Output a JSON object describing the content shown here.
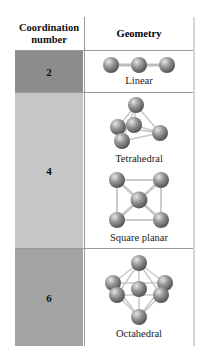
{
  "header": {
    "coordination_number": "Coordination number",
    "coordination_number_line1": "Coordination",
    "coordination_number_line2": "number",
    "geometry": "Geometry"
  },
  "rows": [
    {
      "coordination_number": "2",
      "color": "#8c8c8c",
      "geometries": [
        {
          "name": "Linear",
          "icon": "linear-molecule-icon"
        }
      ]
    },
    {
      "coordination_number": "4",
      "color": "#c6c6c6",
      "geometries": [
        {
          "name": "Tetrahedral",
          "icon": "tetrahedral-molecule-icon"
        },
        {
          "name": "Square planar",
          "icon": "square-planar-molecule-icon"
        }
      ]
    },
    {
      "coordination_number": "6",
      "color": "#a3a3a3",
      "geometries": [
        {
          "name": "Octahedral",
          "icon": "octahedral-molecule-icon"
        }
      ]
    }
  ]
}
